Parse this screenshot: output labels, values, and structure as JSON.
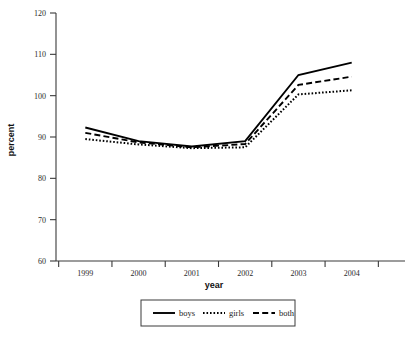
{
  "chart_data": {
    "type": "line",
    "title": "",
    "xlabel": "year",
    "ylabel": "percent",
    "categories": [
      "1999",
      "2000",
      "2001",
      "2002",
      "2003",
      "2004"
    ],
    "x": [
      1999,
      2000,
      2001,
      2002,
      2003,
      2004
    ],
    "ylim": [
      60,
      120
    ],
    "yticks": [
      60,
      70,
      80,
      90,
      100,
      110,
      120
    ],
    "ytick_labels": [
      "60",
      "70",
      "80",
      "90",
      "100",
      "110",
      "120"
    ],
    "grid": false,
    "legend_position": "bottom-center",
    "series": [
      {
        "name": "boys",
        "style": "solid",
        "color": "#000000",
        "values": [
          92.3,
          89.0,
          87.7,
          89.0,
          105.0,
          108.0
        ]
      },
      {
        "name": "girls",
        "style": "dotted",
        "color": "#000000",
        "values": [
          89.5,
          88.2,
          87.3,
          87.5,
          100.3,
          101.3
        ]
      },
      {
        "name": "both",
        "style": "dashed",
        "color": "#000000",
        "values": [
          91.0,
          88.7,
          87.5,
          88.3,
          102.6,
          104.6
        ]
      }
    ]
  },
  "legend": {
    "entries": [
      {
        "label": "boys",
        "style": "solid"
      },
      {
        "label": "girls",
        "style": "dotted"
      },
      {
        "label": "both",
        "style": "dashed"
      }
    ]
  },
  "colors": {
    "background": "#ffffff",
    "axis": "#3a3a3a",
    "ink": "#000000"
  }
}
